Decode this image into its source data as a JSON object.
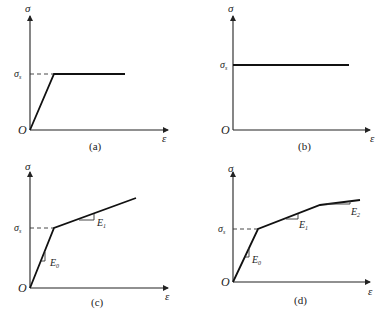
{
  "figure": {
    "panels": [
      {
        "id": "a",
        "caption": "(a)",
        "x_label": "ε",
        "y_label": "σ",
        "origin_label": "O",
        "yield_label": "σ",
        "yield_sub": "s",
        "model": "elastic-perfectly-plastic"
      },
      {
        "id": "b",
        "caption": "(b)",
        "x_label": "ε",
        "y_label": "σ",
        "origin_label": "O",
        "yield_label": "σ",
        "yield_sub": "s",
        "model": "rigid-perfectly-plastic"
      },
      {
        "id": "c",
        "caption": "(c)",
        "x_label": "ε",
        "y_label": "σ",
        "origin_label": "O",
        "yield_label": "σ",
        "yield_sub": "s",
        "slope_labels": [
          {
            "label": "E",
            "sub": "0"
          },
          {
            "label": "E",
            "sub": "1"
          }
        ],
        "model": "bilinear hardening"
      },
      {
        "id": "d",
        "caption": "(d)",
        "x_label": "ε",
        "y_label": "σ",
        "origin_label": "O",
        "yield_label": "σ",
        "yield_sub": "s",
        "slope_labels": [
          {
            "label": "E",
            "sub": "0"
          },
          {
            "label": "E",
            "sub": "1"
          },
          {
            "label": "E",
            "sub": "2"
          }
        ],
        "model": "multilinear hardening"
      }
    ]
  }
}
